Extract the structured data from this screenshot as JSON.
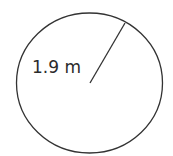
{
  "diagram": {
    "shape": "circle",
    "radius_label": "1.9 m",
    "stroke_color": "#333333",
    "background": "#ffffff"
  }
}
